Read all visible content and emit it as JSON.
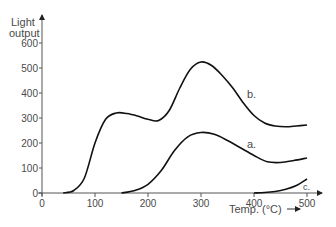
{
  "chart_data": {
    "type": "line",
    "title": "",
    "xlabel": "Temp. (°C)",
    "ylabel_line1": "Light",
    "ylabel_line2": "output",
    "xlim": [
      0,
      500
    ],
    "ylim": [
      0,
      650
    ],
    "x_ticks": [
      "0",
      "100",
      "200",
      "300",
      "400",
      "500"
    ],
    "y_ticks": [
      "0",
      "100",
      "200",
      "300",
      "400",
      "500",
      "600"
    ],
    "grid": false,
    "legend": "inline curve labels",
    "series": [
      {
        "name": "a.",
        "x": [
          150,
          175,
          200,
          225,
          250,
          275,
          300,
          325,
          350,
          375,
          400,
          425,
          450,
          475,
          500
        ],
        "values": [
          0,
          10,
          35,
          90,
          170,
          225,
          242,
          235,
          210,
          180,
          150,
          125,
          122,
          130,
          140
        ]
      },
      {
        "name": "b.",
        "x": [
          40,
          60,
          80,
          100,
          120,
          140,
          160,
          180,
          200,
          220,
          240,
          260,
          280,
          300,
          320,
          340,
          360,
          380,
          400,
          420,
          440,
          460,
          480,
          500
        ],
        "values": [
          0,
          10,
          60,
          200,
          295,
          320,
          318,
          308,
          295,
          290,
          330,
          420,
          495,
          524,
          510,
          470,
          420,
          360,
          310,
          280,
          268,
          265,
          268,
          272
        ]
      },
      {
        "name": "c.",
        "x": [
          400,
          420,
          440,
          460,
          480,
          500
        ],
        "values": [
          0,
          2,
          6,
          15,
          30,
          56
        ]
      }
    ]
  },
  "labels": {
    "y_light": "Light",
    "y_output": "output",
    "x_axis": "Temp. (°C)",
    "series_a": "a.",
    "series_b": "b.",
    "series_c": "c."
  }
}
